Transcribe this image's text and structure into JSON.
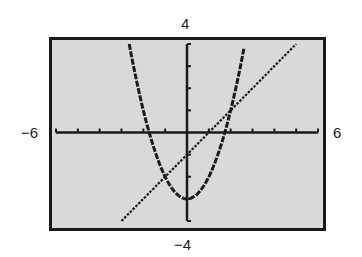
{
  "window": {
    "xmin_label": "−6",
    "xmax_label": "6",
    "ymin_label": "−4",
    "ymax_label": "4"
  },
  "chart_data": {
    "type": "line",
    "title": "",
    "xlabel": "",
    "ylabel": "",
    "xlim": [
      -6,
      6
    ],
    "ylim": [
      -4,
      4
    ],
    "grid": false,
    "legend": null,
    "tick_spacing": {
      "x": 1,
      "y": 1
    },
    "tick_labels": {
      "xmin": "−6",
      "xmax": "6",
      "ymin": "−4",
      "ymax": "4"
    },
    "series": [
      {
        "name": "parabola",
        "equation": "y = x^2 - 3",
        "style": "thick dashed",
        "x": [
          -2.65,
          -2.5,
          -2,
          -1.5,
          -1,
          -0.5,
          0,
          0.5,
          1,
          1.5,
          2,
          2.5,
          2.65
        ],
        "values": [
          4.02,
          3.25,
          1,
          -0.75,
          -2,
          -2.75,
          -3,
          -2.75,
          -2,
          -0.75,
          1,
          3.25,
          4.02
        ]
      },
      {
        "name": "line",
        "equation": "y = x - 1",
        "style": "dotted",
        "x": [
          -3,
          5
        ],
        "values": [
          -4,
          4
        ]
      }
    ],
    "annotations": {
      "intersections": [
        [
          -1,
          -2
        ],
        [
          2,
          1
        ]
      ],
      "parabola_vertex": [
        0,
        -3
      ],
      "parabola_x_intercepts": [
        -1.73,
        1.73
      ],
      "line_intercepts": {
        "x": 1,
        "y": -1
      }
    }
  },
  "colors": {
    "screen_background": "#d9d9d9",
    "ink": "#1a1a1a",
    "page_background": "#ffffff"
  }
}
